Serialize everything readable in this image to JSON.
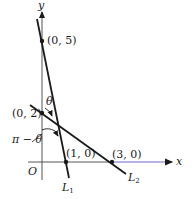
{
  "axes": {
    "x_label": "x",
    "y_label": "y",
    "origin_label": "O"
  },
  "points": [
    {
      "label": "(0, 5)",
      "x": 0,
      "y": 5
    },
    {
      "label": "(0, 2)",
      "x": 0,
      "y": 2
    },
    {
      "label": "(1, 0)",
      "x": 1,
      "y": 0
    },
    {
      "label": "(3, 0)",
      "x": 3,
      "y": 0
    }
  ],
  "lines": [
    {
      "name": "L",
      "subscript": "1",
      "through": [
        "(0, 5)",
        "(1, 0)"
      ]
    },
    {
      "name": "L",
      "subscript": "2",
      "through": [
        "(0, 2)",
        "(3, 0)"
      ]
    }
  ],
  "angles": {
    "theta": "θ",
    "supplement": "π − θ"
  },
  "colors": {
    "ink": "#1a1a1a",
    "x_axis_tint": "#6a6ad0"
  }
}
